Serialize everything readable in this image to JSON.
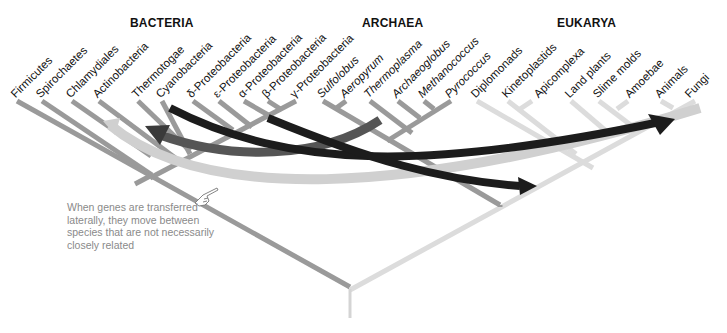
{
  "domains": [
    {
      "label": "BACTERIA",
      "x": 130,
      "y": 16
    },
    {
      "label": "ARCHAEA",
      "x": 362,
      "y": 16
    },
    {
      "label": "EUKARYA",
      "x": 557,
      "y": 16
    }
  ],
  "taxa": {
    "bacteria": [
      "Firmicutes",
      "Spirochaetes",
      "Chlamydiales",
      "Actinobacteria",
      "Thermotogae",
      "Cyanobacteria",
      "δ-Proteobacteria",
      "ε-Proteobacteria",
      "α-Proteobacteria",
      "β-Proteobacteria",
      "γ-Proteobacteria"
    ],
    "archaea": [
      "Sulfolobus",
      "Aeropyrum",
      "Thermoplasma",
      "Archaeoglobus",
      "Methanococcus",
      "Pyrococcus"
    ],
    "eukarya": [
      "Diplomonads",
      "Kinetoplastids",
      "Apicomplexa",
      "Land plants",
      "Slime molds",
      "Amoebae",
      "Animals",
      "Fungi"
    ]
  },
  "annotation": "When genes are transferred laterally, they move between species that are not necessarily closely related",
  "colors": {
    "bacteria_branch": "#9a9a9a",
    "archaea_branch": "#9a9a9a",
    "eukarya_branch": "#dcdcdc",
    "arrow_dark": "#1c1c1c",
    "arrow_mid": "#555555",
    "arrow_light": "#d0d0d0",
    "annotation_text": "#8a8a8a"
  },
  "icons": {
    "pointing_hand": "pointing-hand-icon"
  }
}
